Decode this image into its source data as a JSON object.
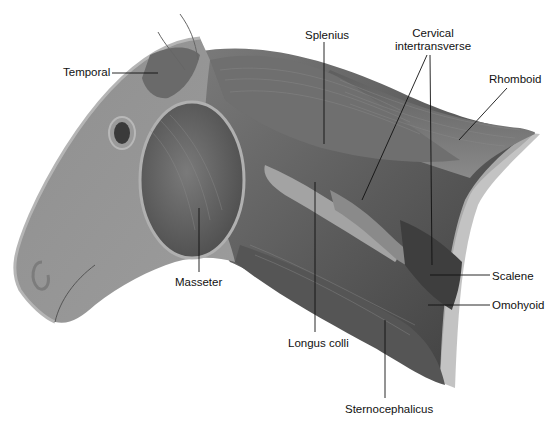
{
  "figure": {
    "labels": {
      "temporal": "Temporal",
      "splenius": "Splenius",
      "cervical_line1": "Cervical",
      "cervical_line2": "intertransverse",
      "rhomboid": "Rhomboid",
      "masseter": "Masseter",
      "longus_colli": "Longus colli",
      "scalene": "Scalene",
      "omohyoid": "Omohyoid",
      "sternocephalicus": "Sternocephalicus"
    },
    "colors": {
      "skin": "#8e8e8e",
      "skin_light": "#a6a6a6",
      "muscle_dark": "#4a4a4a",
      "muscle_mid": "#6b6b6b",
      "muscle_light": "#9a9a9a",
      "outline": "#bdbdbd",
      "leader": "#111111"
    }
  }
}
